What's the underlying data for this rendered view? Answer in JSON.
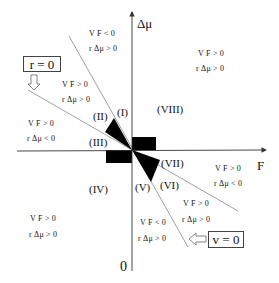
{
  "axes": {
    "x_label": "F",
    "y_label": "Δμ",
    "origin_label": "0"
  },
  "boundary_lines": {
    "r_zero": {
      "label": "r = 0",
      "arrow": "down-arrow"
    },
    "v_zero": {
      "label": "v = 0",
      "arrow": "left-arrow"
    }
  },
  "regions": [
    {
      "id": "I",
      "label": "(I)"
    },
    {
      "id": "II",
      "label": "(II)"
    },
    {
      "id": "III",
      "label": "(III)"
    },
    {
      "id": "IV",
      "label": "(IV)"
    },
    {
      "id": "V",
      "label": "(V)"
    },
    {
      "id": "VI",
      "label": "(VI)"
    },
    {
      "id": "VII",
      "label": "(VII)"
    },
    {
      "id": "VIII",
      "label": "(VIII)"
    }
  ],
  "conditions": [
    {
      "area": "upper-steep-wedge",
      "vf": "V F < 0",
      "rdmu": "r Δμ > 0"
    },
    {
      "area": "upper-between-lines",
      "vf": "V F > 0",
      "rdmu": "r Δμ > 0"
    },
    {
      "area": "left-above-axis",
      "vf": "V F > 0",
      "rdmu": "r Δμ < 0"
    },
    {
      "area": "upper-right-quadrant",
      "vf": "V F > 0",
      "rdmu": "r Δμ > 0"
    },
    {
      "area": "lower-left-quadrant",
      "vf": "V F > 0",
      "rdmu": "r Δμ > 0"
    },
    {
      "area": "right-below-axis",
      "vf": "V F > 0",
      "rdmu": "r Δμ < 0"
    },
    {
      "area": "lower-between-lines",
      "vf": "V F > 0",
      "rdmu": "r Δμ > 0"
    },
    {
      "area": "lower-steep-wedge",
      "vf": "V F < 0",
      "rdmu": "r Δμ > 0"
    }
  ],
  "colors": {
    "axis": "#333333",
    "line": "#777777",
    "fill": "#000000"
  }
}
